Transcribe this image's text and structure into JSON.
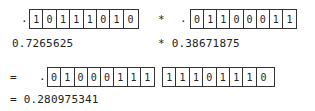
{
  "operand_a": {
    "prefix": ".",
    "bits": [
      "1",
      "0",
      "1",
      "1",
      "1",
      "0",
      "1",
      "0"
    ],
    "decimal": "0.7265625"
  },
  "operator": "*",
  "operand_b": {
    "prefix": ".",
    "bits": [
      "0",
      "1",
      "1",
      "0",
      "0",
      "0",
      "1",
      "1"
    ],
    "decimal": "* 0.38671875"
  },
  "result": {
    "equals": "=",
    "prefix": ".",
    "bits_high": [
      "0",
      "1",
      "0",
      "0",
      "0",
      "1",
      "1",
      "1"
    ],
    "bits_low": [
      "1",
      "1",
      "1",
      "0",
      "1",
      "1",
      "1",
      "0"
    ],
    "decimal": "= 0.280975341"
  }
}
